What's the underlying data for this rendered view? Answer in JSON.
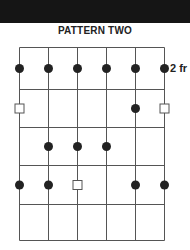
{
  "header": {
    "title": "PATTERN TWO"
  },
  "diagram": {
    "fret_label": "2 fr",
    "strings": 6,
    "frets": 5,
    "colors": {
      "line": "#555555",
      "dot": "#222222",
      "band": "#151515"
    },
    "dots": [
      {
        "fret": 1,
        "string": 1
      },
      {
        "fret": 1,
        "string": 2
      },
      {
        "fret": 1,
        "string": 3
      },
      {
        "fret": 1,
        "string": 4
      },
      {
        "fret": 1,
        "string": 5
      },
      {
        "fret": 1,
        "string": 6
      },
      {
        "fret": 2,
        "string": 5
      },
      {
        "fret": 3,
        "string": 2
      },
      {
        "fret": 3,
        "string": 3
      },
      {
        "fret": 3,
        "string": 4
      },
      {
        "fret": 4,
        "string": 1
      },
      {
        "fret": 4,
        "string": 2
      },
      {
        "fret": 4,
        "string": 5
      },
      {
        "fret": 4,
        "string": 6
      }
    ],
    "squares": [
      {
        "fret": 2,
        "string": 1
      },
      {
        "fret": 2,
        "string": 6
      },
      {
        "fret": 4,
        "string": 3
      }
    ]
  }
}
